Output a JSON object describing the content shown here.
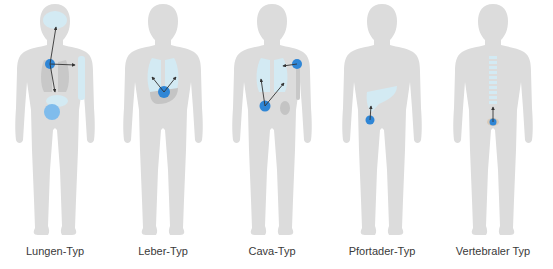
{
  "colors": {
    "body": "#dcdcdc",
    "organ": "#d3eaf3",
    "organ_dark": "#c4c4c4",
    "tumor": "#2f86d6",
    "arrow": "#333333",
    "label": "#3a3a3a"
  },
  "figures": [
    {
      "id": "lungen",
      "label": "Lungen-Typ",
      "origin": "Lunge",
      "targets": [
        "Gehirn",
        "Knochen",
        "Leber/Nebenniere"
      ]
    },
    {
      "id": "leber",
      "label": "Leber-Typ",
      "origin": "Leber",
      "targets": [
        "Lunge links",
        "Lunge rechts"
      ]
    },
    {
      "id": "cava",
      "label": "Cava-Typ",
      "origin": "Niere/Knochen",
      "targets": [
        "Lunge links",
        "Lunge rechts",
        "Lunge"
      ]
    },
    {
      "id": "pfortader",
      "label": "Pfortader-Typ",
      "origin": "Darm",
      "targets": [
        "Leber"
      ]
    },
    {
      "id": "vertebral",
      "label": "Vertebraler Typ",
      "origin": "Becken",
      "targets": [
        "Wirbelsäule"
      ]
    }
  ]
}
